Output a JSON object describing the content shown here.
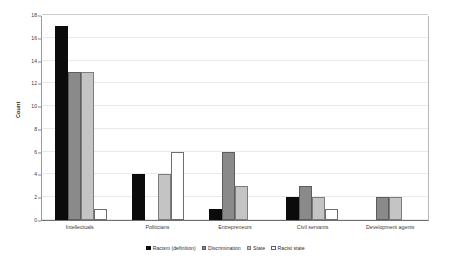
{
  "chart_data": {
    "type": "bar",
    "title": "",
    "subtitle": "",
    "xlabel": "",
    "ylabel": "Count",
    "ylim": [
      0,
      18
    ],
    "ytick_step": 2,
    "yticks": [
      0,
      2,
      4,
      6,
      8,
      10,
      12,
      14,
      16,
      18
    ],
    "grid": true,
    "grid_axis": "y",
    "legend_position": "bottom",
    "categories": [
      "Intellectuals",
      "Politicians",
      "Entrepreneurs",
      "Civil servants",
      "Development agents"
    ],
    "series": [
      {
        "name": "Racism (definition)",
        "color": "#0b0b0b",
        "values": [
          17,
          4,
          1,
          2,
          null
        ]
      },
      {
        "name": "Discrimination",
        "color": "#8a8a8a",
        "values": [
          13,
          null,
          6,
          3,
          2
        ]
      },
      {
        "name": "State",
        "color": "#c4c4c4",
        "values": [
          13,
          4,
          3,
          2,
          2
        ]
      },
      {
        "name": "Racist state",
        "color": "#ffffff",
        "values": [
          1,
          6,
          null,
          1,
          null
        ]
      }
    ]
  },
  "colors": {
    "background": "#ffffff",
    "axis": "#6f6f6f",
    "gridline": "#e9e9e9",
    "text": "#2b2b2b"
  }
}
